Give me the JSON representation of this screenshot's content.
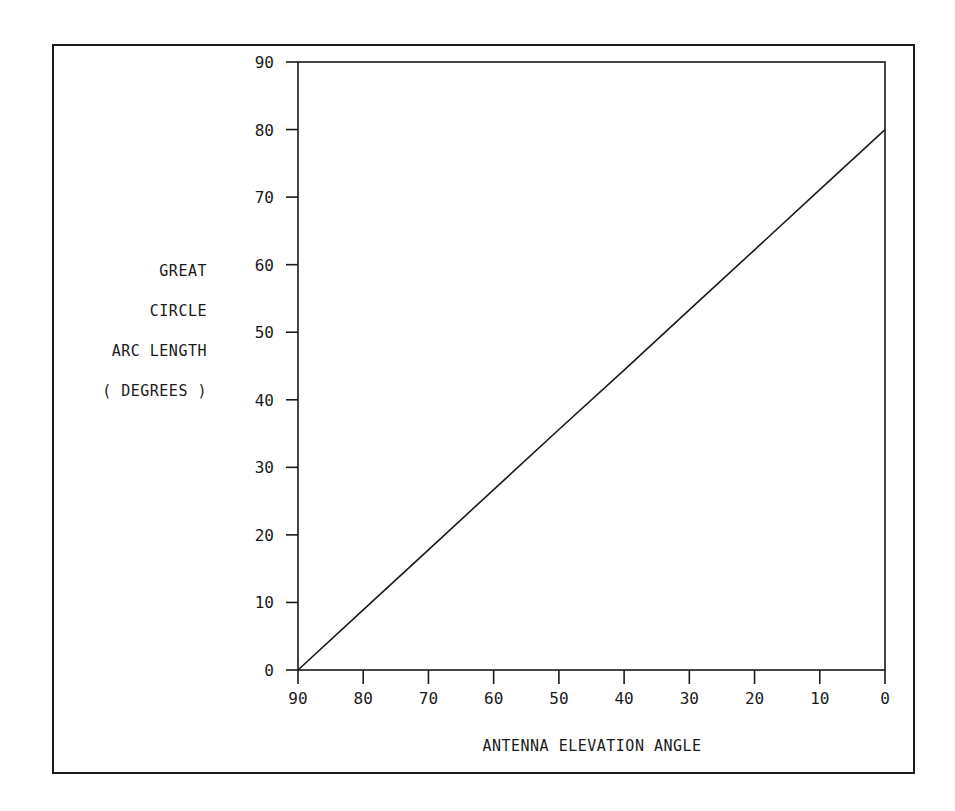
{
  "chart_data": {
    "type": "line",
    "title": "",
    "xlabel": "ANTENNA ELEVATION ANGLE",
    "ylabel": "GREAT CIRCLE ARC LENGTH (DEGREES)",
    "ylabel_lines": [
      "GREAT",
      "CIRCLE",
      "ARC LENGTH",
      "( DEGREES )"
    ],
    "xlim": [
      90,
      0
    ],
    "ylim": [
      0,
      90
    ],
    "x_reversed": true,
    "xticks": [
      90,
      80,
      70,
      60,
      50,
      40,
      30,
      20,
      10,
      0
    ],
    "yticks": [
      0,
      10,
      20,
      30,
      40,
      50,
      60,
      70,
      80,
      90
    ],
    "grid": false,
    "legend": null,
    "series": [
      {
        "name": "arc length",
        "x": [
          90,
          80,
          70,
          60,
          50,
          40,
          30,
          20,
          10,
          0
        ],
        "y": [
          0,
          8.9,
          17.8,
          26.7,
          35.6,
          44.4,
          53.3,
          62.2,
          71.1,
          80
        ]
      }
    ]
  },
  "colors": {
    "ink": "#1a1a1a",
    "background": "#ffffff"
  }
}
